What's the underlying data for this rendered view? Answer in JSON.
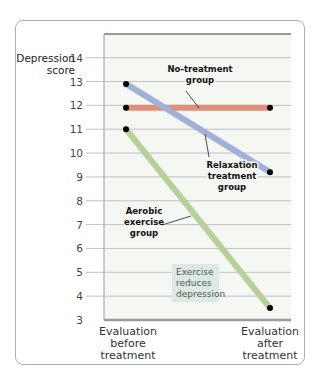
{
  "chart_data": {
    "type": "line",
    "title": "",
    "xlabel": "",
    "ylabel": "Depression score",
    "ylim": [
      3,
      14
    ],
    "yticks": [
      3,
      4,
      5,
      6,
      7,
      8,
      9,
      10,
      11,
      12,
      13,
      14
    ],
    "categories": [
      "Evaluation before treatment",
      "Evaluation after treatment"
    ],
    "grid": true,
    "series": [
      {
        "name": "No-treatment group",
        "color": "#e0907a",
        "values": [
          11.9,
          11.9
        ]
      },
      {
        "name": "Relaxation treatment group",
        "color": "#9fb1d8",
        "values": [
          12.9,
          9.2
        ]
      },
      {
        "name": "Aerobic exercise group",
        "color": "#b5d197",
        "values": [
          11.0,
          3.5
        ]
      }
    ],
    "annotations": [
      "Exercise reduces depression"
    ]
  },
  "labels": {
    "ylabel_line1": "Depression",
    "ylabel_line2": "score",
    "x_before": [
      "Evaluation",
      "before",
      "treatment"
    ],
    "x_after": [
      "Evaluation",
      "after",
      "treatment"
    ],
    "no_treatment": [
      "No-treatment",
      "group"
    ],
    "relaxation": [
      "Relaxation",
      "treatment",
      "group"
    ],
    "aerobic": [
      "Aerobic",
      "exercise",
      "group"
    ],
    "note": [
      "Exercise",
      "reduces",
      "depression"
    ]
  },
  "colors": {
    "plot_bg": "#f4f7f2",
    "grid": "#b9bcc0",
    "note_bg": "#dde9e2"
  }
}
